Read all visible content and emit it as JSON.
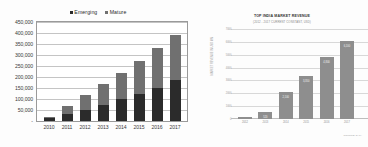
{
  "chart_data": [
    {
      "type": "bar",
      "id": "emerging-mature-stacked",
      "subtype": "stacked-bar",
      "title": "",
      "xlabel": "",
      "ylabel": "",
      "ylim": [
        0,
        450000
      ],
      "grid": true,
      "legend_position": "top",
      "categories": [
        "2010",
        "2011",
        "2012",
        "2013",
        "2014",
        "2015",
        "2016",
        "2017"
      ],
      "ytick_labels": [
        "450,000",
        "400,000",
        "350,000",
        "300,000",
        "250,000",
        "200,000",
        "150,000",
        "100,000",
        "50,000",
        "-"
      ],
      "ytick_values": [
        450000,
        400000,
        350000,
        300000,
        250000,
        200000,
        150000,
        100000,
        50000,
        0
      ],
      "series": [
        {
          "name": "Emerging",
          "color": "#2b2b2b",
          "values": [
            12000,
            30000,
            52000,
            72000,
            98000,
            122000,
            152000,
            188000
          ]
        },
        {
          "name": "Mature",
          "color": "#707070",
          "values": [
            6000,
            38000,
            66000,
            96000,
            122000,
            150000,
            178000,
            202000
          ]
        }
      ],
      "totals": [
        18000,
        68000,
        118000,
        168000,
        220000,
        272000,
        330000,
        390000
      ]
    },
    {
      "type": "bar",
      "id": "top-india-market-revenue",
      "title": "TOP INDIA MARKET REVENUE",
      "subtitle": "(2012 - 2017 CURRENT CONSTANT, USD)",
      "xlabel": "SOURCE: DATA",
      "ylabel": "MARKET REVENUE IN USD MN",
      "ylim": [
        0,
        7000
      ],
      "grid": true,
      "legend_position": "none",
      "categories": [
        "2012",
        "2013",
        "2014",
        "2015",
        "2016",
        "2017"
      ],
      "ytick_labels": [
        "7000",
        "6000",
        "5000",
        "4000",
        "3000",
        "2000",
        "1000",
        "0"
      ],
      "ytick_values": [
        7000,
        6000,
        5000,
        4000,
        3000,
        2000,
        1000,
        0
      ],
      "values": [
        180,
        520,
        2100,
        3350,
        4800,
        6100
      ],
      "bar_labels": [
        "180",
        "520",
        "2,100",
        "3,350",
        "4,800",
        "6,100"
      ],
      "bar_color": "#8e8e8e"
    }
  ],
  "left_chart": {
    "legend": [
      {
        "label": "Emerging",
        "color": "#2b2b2b"
      },
      {
        "label": "Mature",
        "color": "#707070"
      }
    ]
  },
  "right_chart": {
    "title": "TOP INDIA MARKET REVENUE",
    "subtitle": "(2012 - 2017 CURRENT CONSTANT, USD)",
    "axis_label": "MARKET REVENUE IN USD MN",
    "source": "SOURCE: DATA"
  }
}
